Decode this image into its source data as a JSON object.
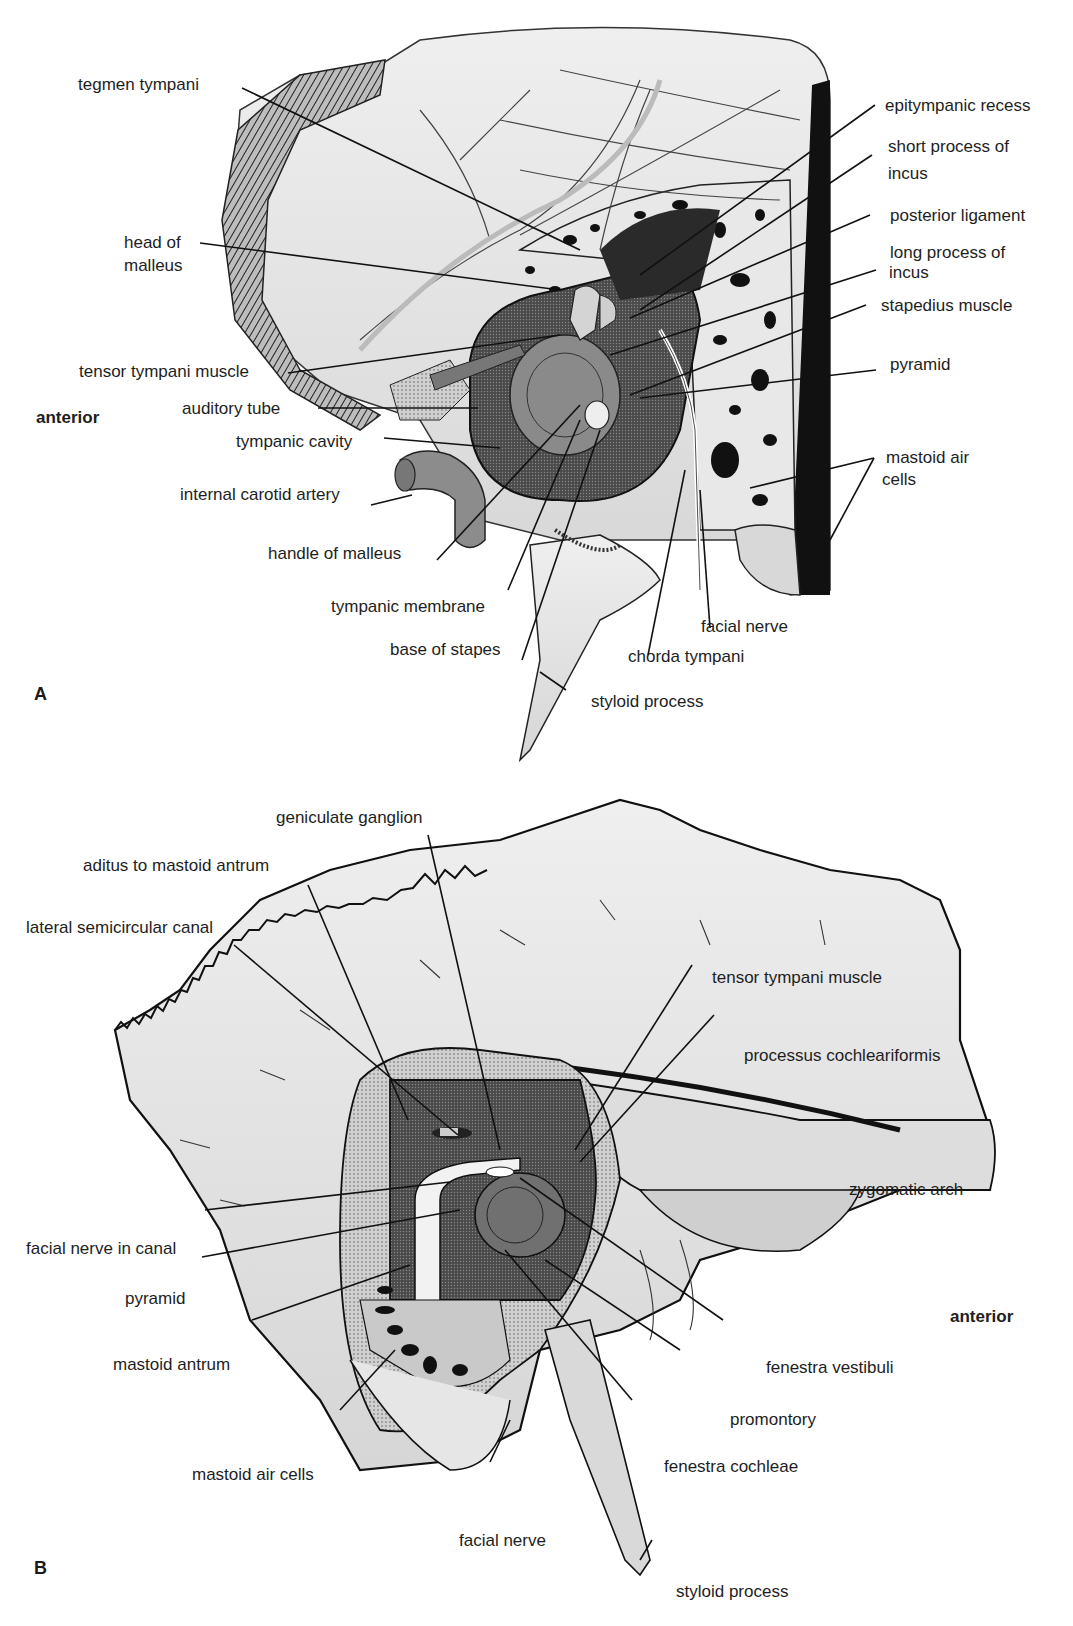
{
  "panel_a": {
    "letter": "A",
    "orientation": "anterior",
    "labels": {
      "tegmen_tympani": "tegmen tympani",
      "head_of_malleus_1": "head of",
      "head_of_malleus_2": "malleus",
      "tensor_tympani_muscle": "tensor tympani muscle",
      "auditory_tube": "auditory tube",
      "tympanic_cavity": "tympanic cavity",
      "internal_carotid_artery": "internal carotid artery",
      "handle_of_malleus": "handle of malleus",
      "tympanic_membrane": "tympanic membrane",
      "base_of_stapes": "base of stapes",
      "styloid_process": "styloid process",
      "chorda_tympani": "chorda tympani",
      "facial_nerve": "facial nerve",
      "epitympanic_recess": "epitympanic recess",
      "short_process_of_incus_1": "short process of",
      "short_process_of_incus_2": "incus",
      "posterior_ligament": "posterior ligament",
      "long_process_of_incus_1": "long process of",
      "long_process_of_incus_2": "incus",
      "stapedius_muscle": "stapedius muscle",
      "pyramid": "pyramid",
      "mastoid_air_cells_1": "mastoid air",
      "mastoid_air_cells_2": "cells"
    }
  },
  "panel_b": {
    "letter": "B",
    "orientation": "anterior",
    "labels": {
      "geniculate_ganglion": "geniculate ganglion",
      "aditus_to_mastoid_antrum": "aditus to mastoid antrum",
      "lateral_semicircular_canal": "lateral semicircular canal",
      "tensor_tympani_muscle": "tensor tympani muscle",
      "processus_cochleariformis": "processus cochleariformis",
      "zygomatic_arch": "zygomatic arch",
      "facial_nerve_in_canal": "facial nerve in canal",
      "pyramid": "pyramid",
      "mastoid_antrum": "mastoid antrum",
      "mastoid_air_cells": "mastoid air cells",
      "facial_nerve": "facial nerve",
      "fenestra_vestibuli": "fenestra vestibuli",
      "promontory": "promontory",
      "fenestra_cochleae": "fenestra  cochleae",
      "styloid_process": "styloid process"
    }
  },
  "colors": {
    "bone_light": "#e4e4e4",
    "bone_mid": "#c8c8c8",
    "cavity_dark": "#5a5a5a",
    "black": "#111111",
    "stipple": "#9a9a9a"
  }
}
